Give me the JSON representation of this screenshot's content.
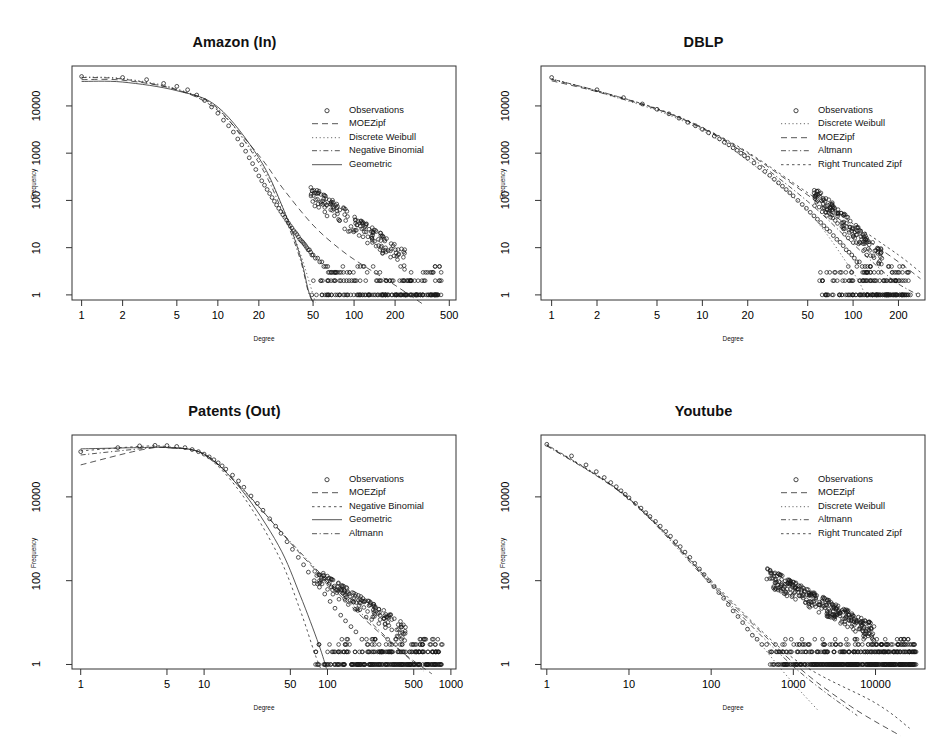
{
  "figure": {
    "background": "#ffffff",
    "axis_color": "#333333",
    "point_color": "#1a1a1a",
    "width": 939,
    "height": 739
  },
  "common": {
    "xlabel": "Degree",
    "ylabel": "Frequency",
    "observations_label": "Observations"
  },
  "chart_data": [
    {
      "type": "scatter",
      "panel": "top-left",
      "title": "Amazon (In)",
      "xlabel": "Degree",
      "ylabel": "Frequency",
      "xscale": "log",
      "yscale": "log",
      "xticks": [
        1,
        2,
        5,
        10,
        20,
        50,
        100,
        200,
        500
      ],
      "xtick_labels": [
        "1",
        "2",
        "5",
        "10",
        "20",
        "50",
        "100",
        "200",
        "500"
      ],
      "yticks": [
        1,
        10,
        100,
        1000,
        10000
      ],
      "ytick_labels": [
        "1",
        "10",
        "100",
        "1000",
        "10000"
      ],
      "xlim": [
        0.85,
        560
      ],
      "ylim": [
        0.78,
        70000
      ],
      "grid": false,
      "legend_position": "top-right-inside",
      "legend": [
        {
          "name": "Observations",
          "style": "points"
        },
        {
          "name": "MOEZipf",
          "style": "dashed"
        },
        {
          "name": "Discrete Weibull",
          "style": "dotted-fine"
        },
        {
          "name": "Negative Binomial",
          "style": "dotdash"
        },
        {
          "name": "Geometric",
          "style": "solid"
        }
      ],
      "observations": {
        "x": [
          1,
          2,
          3,
          4,
          5,
          6,
          7,
          8,
          9,
          10,
          11,
          12,
          13,
          14,
          15,
          16,
          17,
          18,
          19,
          20,
          21,
          22,
          23,
          24,
          25,
          26,
          27,
          28,
          29,
          30,
          31,
          32,
          33,
          34,
          35,
          36,
          37,
          38,
          39,
          40,
          41,
          42,
          43,
          44,
          45,
          46,
          47,
          48,
          49,
          50,
          52,
          54,
          56,
          58,
          60,
          62,
          64,
          66,
          68,
          70,
          72,
          75,
          78,
          80,
          84,
          88,
          92,
          96,
          100,
          105,
          110,
          115,
          120,
          130,
          140,
          150,
          160,
          175,
          190,
          205,
          220,
          240,
          260,
          290,
          320,
          350
        ],
        "y": [
          42000,
          40000,
          36000,
          30000,
          26000,
          22000,
          17000,
          13000,
          9500,
          7000,
          5000,
          3800,
          2800,
          2000,
          1500,
          1100,
          800,
          600,
          450,
          330,
          260,
          210,
          170,
          140,
          115,
          96,
          80,
          68,
          58,
          50,
          44,
          38,
          33,
          29,
          26,
          23,
          21,
          19,
          17,
          15,
          14,
          13,
          12,
          11,
          10,
          9,
          9,
          8,
          7,
          7,
          6,
          6,
          5,
          5,
          4,
          4,
          4,
          3,
          3,
          3,
          3,
          3,
          3,
          2,
          2,
          2,
          2,
          2,
          2,
          1,
          1,
          1,
          1,
          1,
          1,
          1,
          1,
          1,
          1,
          1,
          1,
          1,
          1,
          1,
          1,
          1
        ]
      },
      "fitted_curves": {
        "MOEZipf": {
          "x": [
            1,
            2,
            5,
            10,
            20,
            30,
            50,
            80,
            120,
            200,
            330
          ],
          "y": [
            36000,
            35000,
            22000,
            8000,
            900,
            180,
            30,
            9,
            4,
            1.6,
            0.6
          ]
        },
        "Discrete Weibull": {
          "x": [
            1,
            2,
            5,
            10,
            20,
            30,
            40,
            48,
            52
          ],
          "y": [
            41000,
            38000,
            23000,
            8500,
            700,
            70,
            8,
            1.5,
            0.7
          ]
        },
        "Negative Binomial": {
          "x": [
            1,
            2,
            5,
            10,
            20,
            30,
            40,
            46,
            50
          ],
          "y": [
            40000,
            37000,
            22000,
            8800,
            620,
            55,
            6,
            1.2,
            0.7
          ]
        },
        "Geometric": {
          "x": [
            1,
            2,
            5,
            10,
            20,
            30,
            40,
            46,
            50
          ],
          "y": [
            33000,
            32000,
            21000,
            9500,
            800,
            70,
            7,
            1.3,
            0.7
          ]
        }
      }
    },
    {
      "type": "scatter",
      "panel": "top-right",
      "title": "DBLP",
      "xlabel": "Degree",
      "ylabel": "Frequency",
      "xscale": "log",
      "yscale": "log",
      "xticks": [
        1,
        2,
        5,
        10,
        20,
        50,
        100,
        200
      ],
      "xtick_labels": [
        "1",
        "2",
        "5",
        "10",
        "20",
        "50",
        "100",
        "200"
      ],
      "yticks": [
        1,
        10,
        100,
        1000,
        10000
      ],
      "ytick_labels": [
        "1",
        "10",
        "100",
        "1000",
        "10000"
      ],
      "xlim": [
        0.85,
        300
      ],
      "ylim": [
        0.78,
        70000
      ],
      "grid": false,
      "legend_position": "top-right-inside",
      "legend": [
        {
          "name": "Observations",
          "style": "points"
        },
        {
          "name": "Discrete Weibull",
          "style": "dotted-fine"
        },
        {
          "name": "MOEZipf",
          "style": "dashed"
        },
        {
          "name": "Altmann",
          "style": "dotdash"
        },
        {
          "name": "Right Truncated Zipf",
          "style": "dotted"
        }
      ],
      "observations": {
        "x": [
          1,
          2,
          3,
          4,
          5,
          6,
          7,
          8,
          9,
          10,
          11,
          12,
          13,
          14,
          15,
          16,
          17,
          18,
          19,
          20,
          22,
          24,
          26,
          28,
          30,
          32,
          34,
          36,
          38,
          40,
          43,
          46,
          49,
          52,
          55,
          58,
          61,
          64,
          67,
          70,
          74,
          78,
          82,
          86,
          90,
          94,
          98,
          102,
          106,
          110,
          115,
          120,
          125,
          130,
          140,
          150,
          160,
          175,
          190,
          210,
          240,
          270
        ],
        "y": [
          40000,
          22000,
          15000,
          11000,
          8500,
          6800,
          5500,
          4500,
          3800,
          3200,
          2700,
          2300,
          2000,
          1700,
          1500,
          1300,
          1150,
          1000,
          880,
          780,
          620,
          500,
          410,
          340,
          280,
          235,
          200,
          170,
          145,
          125,
          100,
          82,
          68,
          56,
          47,
          40,
          34,
          29,
          25,
          22,
          18,
          15,
          13,
          11,
          9,
          8,
          7,
          6,
          5,
          5,
          4,
          4,
          3,
          3,
          2,
          2,
          2,
          1,
          1,
          1,
          1,
          1
        ]
      },
      "fitted_curves": {
        "Discrete Weibull": {
          "x": [
            1,
            2,
            5,
            10,
            20,
            50,
            100,
            120
          ],
          "y": [
            38000,
            20000,
            8000,
            3000,
            700,
            60,
            3,
            1
          ]
        },
        "MOEZipf": {
          "x": [
            1,
            2,
            5,
            10,
            20,
            50,
            100,
            200,
            280
          ],
          "y": [
            34000,
            20000,
            8500,
            3400,
            1000,
            130,
            24,
            5,
            2.2
          ]
        },
        "Altmann": {
          "x": [
            1,
            2,
            5,
            10,
            20,
            50,
            100,
            160,
            200,
            270
          ],
          "y": [
            36000,
            21000,
            8600,
            3300,
            900,
            95,
            12,
            3,
            1.7,
            1
          ]
        },
        "Right Truncated Zipf": {
          "x": [
            1,
            2,
            5,
            10,
            20,
            50,
            100,
            200,
            280
          ],
          "y": [
            37000,
            21000,
            8800,
            3500,
            1050,
            145,
            32,
            7,
            3
          ]
        }
      }
    },
    {
      "type": "scatter",
      "panel": "bottom-left",
      "title": "Patents (Out)",
      "xlabel": "Degree",
      "ylabel": "Frequency",
      "xscale": "log",
      "yscale": "log",
      "xticks": [
        1,
        5,
        10,
        50,
        100,
        500,
        1000
      ],
      "xtick_labels": [
        "1",
        "5",
        "10",
        "50",
        "100",
        "500",
        "1000"
      ],
      "yticks": [
        1,
        100,
        10000
      ],
      "ytick_labels": [
        "1",
        "100",
        "10000"
      ],
      "xlim": [
        0.85,
        1100
      ],
      "ylim": [
        0.78,
        300000
      ],
      "grid": false,
      "legend_position": "top-right-inside",
      "legend": [
        {
          "name": "Observations",
          "style": "points"
        },
        {
          "name": "MOEZipf",
          "style": "dashed"
        },
        {
          "name": "Negative Binomial",
          "style": "dotted"
        },
        {
          "name": "Geometric",
          "style": "solid"
        },
        {
          "name": "Altmann",
          "style": "dotdash"
        }
      ],
      "observations": {
        "x": [
          1,
          2,
          3,
          4,
          5,
          6,
          7,
          8,
          9,
          10,
          11,
          12,
          13,
          14,
          15,
          17,
          19,
          21,
          24,
          27,
          30,
          34,
          38,
          42,
          47,
          52,
          58,
          64,
          70,
          78,
          86,
          95,
          105,
          115,
          128,
          140,
          155,
          170,
          190,
          210,
          230,
          255,
          280,
          310,
          340,
          375,
          410,
          450,
          500,
          560,
          620,
          700,
          800
        ],
        "y": [
          120000,
          150000,
          165000,
          170000,
          168000,
          160000,
          150000,
          135000,
          120000,
          105000,
          90000,
          77000,
          65000,
          55000,
          46000,
          33000,
          24000,
          17000,
          10500,
          7000,
          4800,
          3000,
          2000,
          1350,
          850,
          560,
          360,
          240,
          160,
          100,
          70,
          48,
          32,
          22,
          15,
          11,
          8,
          6,
          4,
          3,
          3,
          2,
          2,
          2,
          1,
          1,
          1,
          1,
          1,
          1,
          1,
          1,
          1
        ]
      },
      "fitted_curves": {
        "MOEZipf": {
          "x": [
            1,
            3,
            5,
            10,
            20,
            50,
            100,
            200,
            400,
            700
          ],
          "y": [
            58000,
            130000,
            150000,
            105000,
            17000,
            800,
            90,
            12,
            2,
            0.6
          ]
        },
        "Negative Binomial": {
          "x": [
            1,
            3,
            5,
            10,
            20,
            40,
            60,
            78,
            88
          ],
          "y": [
            125000,
            160000,
            158000,
            100000,
            12000,
            400,
            20,
            2,
            0.8
          ]
        },
        "Geometric": {
          "x": [
            1,
            3,
            5,
            10,
            20,
            40,
            60,
            85,
            98
          ],
          "y": [
            140000,
            150000,
            150000,
            105000,
            15000,
            700,
            45,
            3,
            0.8
          ]
        },
        "Altmann": {
          "x": [
            1,
            3,
            5,
            10,
            20,
            50,
            100,
            200,
            400,
            600
          ],
          "y": [
            100000,
            140000,
            150000,
            105000,
            16000,
            850,
            100,
            14,
            2,
            0.7
          ]
        }
      }
    },
    {
      "type": "scatter",
      "panel": "bottom-right",
      "title": "Youtube",
      "xlabel": "Degree",
      "ylabel": "Frequency",
      "xscale": "log",
      "yscale": "log",
      "xticks": [
        1,
        10,
        100,
        1000,
        10000
      ],
      "xtick_labels": [
        "1",
        "10",
        "100",
        "1000",
        "10000"
      ],
      "yticks": [
        1,
        100,
        10000
      ],
      "ytick_labels": [
        "1",
        "100",
        "10000"
      ],
      "xlim": [
        0.85,
        40000
      ],
      "ylim": [
        0.78,
        300000
      ],
      "grid": false,
      "legend_position": "top-right-inside",
      "legend": [
        {
          "name": "Observations",
          "style": "points"
        },
        {
          "name": "MOEZipf",
          "style": "dashed"
        },
        {
          "name": "Discrete Weibull",
          "style": "dotted-fine"
        },
        {
          "name": "Altmann",
          "style": "dotdash"
        },
        {
          "name": "Right Truncated Zipf",
          "style": "dotted"
        }
      ],
      "observations": {
        "x": [
          1,
          2,
          3,
          4,
          5,
          6,
          7,
          8,
          9,
          10,
          12,
          14,
          16,
          18,
          21,
          24,
          28,
          32,
          37,
          42,
          48,
          55,
          63,
          72,
          82,
          94,
          108,
          124,
          142,
          162,
          185,
          212,
          242,
          277,
          317,
          362,
          414,
          473,
          541,
          618,
          707,
          808,
          924,
          1056,
          1207,
          1380,
          1577,
          1803,
          2061,
          2356,
          2693,
          3078,
          3519,
          4022,
          4598,
          5255,
          6006,
          6865,
          7847,
          8970,
          10253,
          11720,
          13397,
          15314,
          17505,
          20008,
          22868,
          26136
        ],
        "y": [
          180000,
          95000,
          58000,
          40000,
          29000,
          22000,
          17500,
          14000,
          11500,
          9500,
          7000,
          5400,
          4200,
          3400,
          2600,
          2000,
          1500,
          1150,
          850,
          650,
          480,
          360,
          260,
          190,
          140,
          100,
          72,
          52,
          38,
          27,
          19,
          14,
          10,
          7,
          5,
          4,
          3,
          3,
          2,
          2,
          2,
          1,
          1,
          1,
          1,
          1,
          1,
          1,
          1,
          1,
          1,
          1,
          1,
          1,
          1,
          1,
          1,
          1,
          1,
          1,
          1,
          1,
          1,
          1,
          1,
          1,
          1,
          1
        ]
      },
      "fitted_curves": {
        "MOEZipf": {
          "x": [
            1,
            10,
            100,
            1000,
            5000,
            20000
          ],
          "y": [
            170000,
            9000,
            90,
            1.1,
            0.1,
            0.02
          ]
        },
        "Discrete Weibull": {
          "x": [
            1,
            10,
            100,
            700,
            2000
          ],
          "y": [
            175000,
            9200,
            85,
            0.8,
            0.08
          ]
        },
        "Altmann": {
          "x": [
            1,
            10,
            100,
            1000,
            6000
          ],
          "y": [
            165000,
            8800,
            80,
            0.9,
            0.06
          ]
        },
        "Right Truncated Zipf": {
          "x": [
            1,
            10,
            100,
            1000,
            10000,
            26000
          ],
          "y": [
            178000,
            9400,
            100,
            1.4,
            0.12,
            0.03
          ]
        }
      }
    }
  ]
}
